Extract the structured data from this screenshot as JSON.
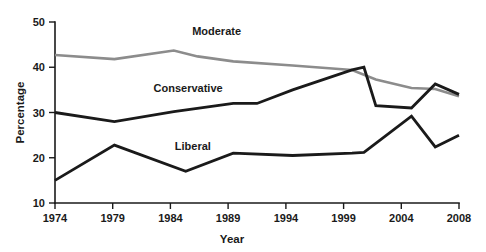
{
  "chart_data": {
    "type": "line",
    "title": "",
    "xlabel": "Year",
    "ylabel": "Percentage",
    "xlim": [
      1974,
      2008
    ],
    "ylim": [
      10,
      50
    ],
    "xticks": [
      1974,
      1979,
      1984,
      1989,
      1994,
      1999,
      2004,
      2008
    ],
    "yticks": [
      10,
      20,
      30,
      40,
      50
    ],
    "grid": false,
    "legend": "inline-labels",
    "colors": {
      "moderate": "#8c8c8c",
      "conservative": "#1a1a1a",
      "liberal": "#1a1a1a",
      "axis": "#1a1a1a",
      "background": "#ffffff"
    },
    "series": [
      {
        "name": "Moderate",
        "color": "#8c8c8c",
        "label_position": {
          "x": 1987.6,
          "y": 47.2
        },
        "x": [
          1974,
          1979,
          1984,
          1986,
          1989,
          1994,
          1999,
          2001,
          2004,
          2006,
          2008
        ],
        "values": [
          42.7,
          41.8,
          43.7,
          42.4,
          41.3,
          40.4,
          39.4,
          37.3,
          35.4,
          35.2,
          33.6
        ]
      },
      {
        "name": "Conservative",
        "color": "#1a1a1a",
        "label_position": {
          "x": 1985.2,
          "y": 34.6
        },
        "x": [
          1974,
          1979,
          1984,
          1989,
          1991,
          1994,
          1999,
          2000,
          2001,
          2004,
          2006,
          2008
        ],
        "values": [
          30.0,
          28.0,
          30.2,
          32.0,
          32.0,
          35.0,
          39.4,
          40.0,
          31.5,
          31.0,
          36.3,
          34.0
        ]
      },
      {
        "name": "Liberal",
        "color": "#1a1a1a",
        "label_position": {
          "x": 1985.6,
          "y": 21.8
        },
        "x": [
          1974,
          1979,
          1985,
          1989,
          1994,
          1999,
          2000,
          2004,
          2006,
          2008
        ],
        "values": [
          15.0,
          22.8,
          17.0,
          21.0,
          20.5,
          21.0,
          21.2,
          29.2,
          22.4,
          25.0
        ]
      }
    ]
  },
  "axes": {
    "y_title": "Percentage",
    "x_title": "Year",
    "y_tick_labels": [
      "50",
      "40",
      "30",
      "20",
      "10"
    ],
    "x_tick_labels": [
      "1974",
      "1979",
      "1984",
      "1989",
      "1994",
      "1999",
      "2004",
      "2008"
    ]
  },
  "series_labels": {
    "moderate": "Moderate",
    "conservative": "Conservative",
    "liberal": "Liberal"
  }
}
